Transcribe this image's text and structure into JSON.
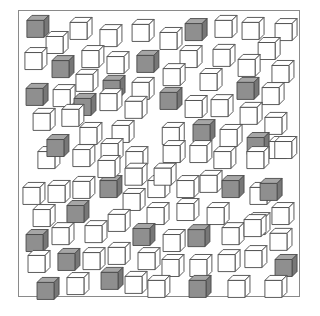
{
  "figure": {
    "colors": {
      "gray_front": "#8f8f8f",
      "gray_top": "#a6a6a6",
      "gray_side": "#777777",
      "white_face": "#ffffff",
      "outline": "#4a4a4a",
      "frame": "#8a8a8a"
    },
    "counts": {
      "gray": 26,
      "white": 84
    },
    "cubes": [
      {
        "t": "g",
        "x": 0.067,
        "y": 0.045
      },
      {
        "t": "w",
        "x": 0.22,
        "y": 0.052
      },
      {
        "t": "w",
        "x": 0.326,
        "y": 0.077
      },
      {
        "t": "w",
        "x": 0.44,
        "y": 0.059
      },
      {
        "t": "w",
        "x": 0.539,
        "y": 0.087
      },
      {
        "t": "g",
        "x": 0.628,
        "y": 0.056
      },
      {
        "t": "w",
        "x": 0.734,
        "y": 0.045
      },
      {
        "t": "w",
        "x": 0.83,
        "y": 0.052
      },
      {
        "t": "w",
        "x": 0.947,
        "y": 0.056
      },
      {
        "t": "w",
        "x": 0.135,
        "y": 0.101
      },
      {
        "t": "w",
        "x": 0.06,
        "y": 0.157
      },
      {
        "t": "g",
        "x": 0.156,
        "y": 0.185
      },
      {
        "t": "w",
        "x": 0.262,
        "y": 0.15
      },
      {
        "t": "w",
        "x": 0.351,
        "y": 0.171
      },
      {
        "t": "g",
        "x": 0.457,
        "y": 0.167
      },
      {
        "t": "w",
        "x": 0.61,
        "y": 0.15
      },
      {
        "t": "w",
        "x": 0.727,
        "y": 0.146
      },
      {
        "t": "w",
        "x": 0.887,
        "y": 0.122
      },
      {
        "t": "w",
        "x": 0.241,
        "y": 0.233
      },
      {
        "t": "g",
        "x": 0.337,
        "y": 0.254
      },
      {
        "t": "w",
        "x": 0.55,
        "y": 0.213
      },
      {
        "t": "w",
        "x": 0.681,
        "y": 0.23
      },
      {
        "t": "w",
        "x": 0.816,
        "y": 0.181
      },
      {
        "t": "w",
        "x": 0.936,
        "y": 0.202
      },
      {
        "t": "g",
        "x": 0.064,
        "y": 0.282
      },
      {
        "t": "w",
        "x": 0.16,
        "y": 0.286
      },
      {
        "t": "w",
        "x": 0.44,
        "y": 0.261
      },
      {
        "t": "g",
        "x": 0.812,
        "y": 0.261
      },
      {
        "t": "w",
        "x": 0.901,
        "y": 0.279
      },
      {
        "t": "g",
        "x": 0.539,
        "y": 0.296
      },
      {
        "t": "w",
        "x": 0.628,
        "y": 0.324
      },
      {
        "t": "w",
        "x": 0.72,
        "y": 0.321
      },
      {
        "t": "w",
        "x": 0.823,
        "y": 0.348
      },
      {
        "t": "w",
        "x": 0.911,
        "y": 0.383
      },
      {
        "t": "w",
        "x": 0.089,
        "y": 0.369
      },
      {
        "t": "g",
        "x": 0.234,
        "y": 0.317
      },
      {
        "t": "w",
        "x": 0.326,
        "y": 0.3
      },
      {
        "t": "w",
        "x": 0.191,
        "y": 0.355
      },
      {
        "t": "w",
        "x": 0.415,
        "y": 0.327
      },
      {
        "t": "w",
        "x": 0.255,
        "y": 0.418
      },
      {
        "t": "w",
        "x": 0.369,
        "y": 0.411
      },
      {
        "t": "w",
        "x": 0.547,
        "y": 0.418
      },
      {
        "t": "g",
        "x": 0.656,
        "y": 0.408
      },
      {
        "t": "w",
        "x": 0.752,
        "y": 0.425
      },
      {
        "t": "g",
        "x": 0.848,
        "y": 0.453
      },
      {
        "t": "w",
        "x": 0.926,
        "y": 0.467
      },
      {
        "t": "w",
        "x": 0.106,
        "y": 0.502
      },
      {
        "t": "g",
        "x": 0.138,
        "y": 0.46
      },
      {
        "t": "w",
        "x": 0.23,
        "y": 0.495
      },
      {
        "t": "w",
        "x": 0.33,
        "y": 0.474
      },
      {
        "t": "w",
        "x": 0.418,
        "y": 0.502
      },
      {
        "t": "w",
        "x": 0.55,
        "y": 0.481
      },
      {
        "t": "w",
        "x": 0.645,
        "y": 0.481
      },
      {
        "t": "w",
        "x": 0.73,
        "y": 0.502
      },
      {
        "t": "w",
        "x": 0.847,
        "y": 0.502
      },
      {
        "t": "w",
        "x": 0.946,
        "y": 0.467
      },
      {
        "t": "w",
        "x": 0.053,
        "y": 0.627
      },
      {
        "t": "w",
        "x": 0.142,
        "y": 0.62
      },
      {
        "t": "w",
        "x": 0.23,
        "y": 0.606
      },
      {
        "t": "g",
        "x": 0.326,
        "y": 0.603
      },
      {
        "t": "w",
        "x": 0.408,
        "y": 0.648
      },
      {
        "t": "w",
        "x": 0.496,
        "y": 0.603
      },
      {
        "t": "w",
        "x": 0.599,
        "y": 0.603
      },
      {
        "t": "w",
        "x": 0.681,
        "y": 0.585
      },
      {
        "t": "g",
        "x": 0.759,
        "y": 0.603
      },
      {
        "t": "w",
        "x": 0.858,
        "y": 0.627
      },
      {
        "t": "g",
        "x": 0.894,
        "y": 0.613
      },
      {
        "t": "w",
        "x": 0.089,
        "y": 0.704
      },
      {
        "t": "g",
        "x": 0.209,
        "y": 0.69
      },
      {
        "t": "w",
        "x": 0.355,
        "y": 0.721
      },
      {
        "t": "w",
        "x": 0.493,
        "y": 0.697
      },
      {
        "t": "w",
        "x": 0.599,
        "y": 0.683
      },
      {
        "t": "w",
        "x": 0.706,
        "y": 0.697
      },
      {
        "t": "w",
        "x": 0.851,
        "y": 0.732
      },
      {
        "t": "w",
        "x": 0.936,
        "y": 0.697
      },
      {
        "t": "g",
        "x": 0.064,
        "y": 0.791
      },
      {
        "t": "w",
        "x": 0.156,
        "y": 0.767
      },
      {
        "t": "w",
        "x": 0.273,
        "y": 0.76
      },
      {
        "t": "g",
        "x": 0.443,
        "y": 0.77
      },
      {
        "t": "w",
        "x": 0.55,
        "y": 0.791
      },
      {
        "t": "g",
        "x": 0.638,
        "y": 0.774
      },
      {
        "t": "w",
        "x": 0.759,
        "y": 0.767
      },
      {
        "t": "w",
        "x": 0.837,
        "y": 0.739
      },
      {
        "t": "w",
        "x": 0.929,
        "y": 0.787
      },
      {
        "t": "w",
        "x": 0.071,
        "y": 0.864
      },
      {
        "t": "g",
        "x": 0.177,
        "y": 0.857
      },
      {
        "t": "w",
        "x": 0.266,
        "y": 0.854
      },
      {
        "t": "w",
        "x": 0.355,
        "y": 0.836
      },
      {
        "t": "w",
        "x": 0.461,
        "y": 0.854
      },
      {
        "t": "w",
        "x": 0.546,
        "y": 0.878
      },
      {
        "t": "w",
        "x": 0.645,
        "y": 0.878
      },
      {
        "t": "w",
        "x": 0.745,
        "y": 0.861
      },
      {
        "t": "w",
        "x": 0.84,
        "y": 0.847
      },
      {
        "t": "g",
        "x": 0.947,
        "y": 0.878
      },
      {
        "t": "g",
        "x": 0.103,
        "y": 0.958
      },
      {
        "t": "w",
        "x": 0.209,
        "y": 0.941
      },
      {
        "t": "g",
        "x": 0.33,
        "y": 0.923
      },
      {
        "t": "w",
        "x": 0.415,
        "y": 0.937
      },
      {
        "t": "w",
        "x": 0.496,
        "y": 0.951
      },
      {
        "t": "g",
        "x": 0.642,
        "y": 0.951
      },
      {
        "t": "w",
        "x": 0.78,
        "y": 0.951
      },
      {
        "t": "w",
        "x": 0.911,
        "y": 0.951
      },
      {
        "t": "w",
        "x": 0.518,
        "y": 0.56
      },
      {
        "t": "w",
        "x": 0.415,
        "y": 0.56
      },
      {
        "t": "w",
        "x": 0.319,
        "y": 0.533
      }
    ]
  }
}
